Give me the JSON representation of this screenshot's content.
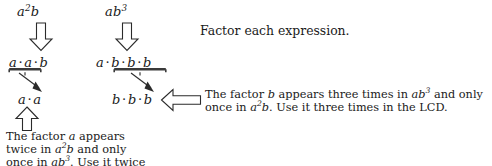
{
  "page": {
    "width": 492,
    "height": 166,
    "background": "#ffffff",
    "ink": "#1a1a1a"
  },
  "instruction": {
    "text": "Factor each expression."
  },
  "columns": [
    {
      "id": "column-a",
      "expression_plain": "a2b",
      "expression_base": "a",
      "expression_exponent": "2",
      "expression_tail": "b",
      "factored_plain": "a · a · b",
      "factored_tokens": [
        "a",
        "·",
        "a",
        "·",
        "b"
      ],
      "highlighted_plain": "a · a",
      "highlighted_tokens": [
        "a",
        "·",
        "a"
      ],
      "arrow_down": "down-block-arrow",
      "arrow_up": "up-block-arrow"
    },
    {
      "id": "column-b",
      "expression_plain": "ab3",
      "expression_base": "ab",
      "expression_exponent": "3",
      "expression_tail": "",
      "factored_plain": "a · b · b · b",
      "factored_tokens": [
        "a",
        "·",
        "b",
        "·",
        "b",
        "·",
        "b"
      ],
      "highlighted_plain": "b · b · b",
      "highlighted_tokens": [
        "b",
        "·",
        "b",
        "·",
        "b"
      ],
      "arrow_down": "down-block-arrow"
    }
  ],
  "callout_b": {
    "arrow": "left-block-arrow",
    "line1_pre": "The factor ",
    "line1_var": "b",
    "line1_mid": " appears three times in ",
    "line1_expr_base": "ab",
    "line1_expr_exp": "3",
    "line1_post": " and only",
    "line2_pre": "once in ",
    "line2_expr_base": "a",
    "line2_expr_exp": "2",
    "line2_expr_tail": "b",
    "line2_post": ".  Use it three times in the LCD."
  },
  "callout_a": {
    "arrow": "up-block-arrow",
    "line1_pre": "The   factor   ",
    "line1_var": "a",
    "line1_post": "   appears",
    "line2_pre": "twice  in  ",
    "line2_expr_base": "a",
    "line2_expr_exp": "2",
    "line2_expr_tail": "b",
    "line2_post": "  and  only",
    "line3_pre": "once in ",
    "line3_expr_base": "ab",
    "line3_expr_exp": "3",
    "line3_post": ".  Use it twice"
  }
}
